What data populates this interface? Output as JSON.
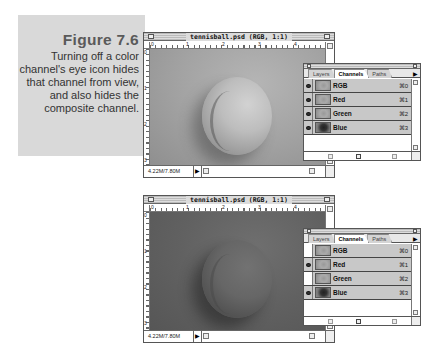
{
  "caption": {
    "figure": "Figure 7.6",
    "text": "Turning off a color channel's eye icon hides that channel from view, and also hides the composite channel."
  },
  "windows": [
    {
      "id": "top",
      "title": "tennisball.psd (RGB, 1:1)",
      "ruler_h": [
        "0",
        "1",
        "2",
        "3",
        "4"
      ],
      "ruler_v": [
        "0",
        "1",
        "2",
        "3"
      ],
      "status": "4.22M/7.80M",
      "play_icon": "▶"
    },
    {
      "id": "bottom",
      "title": "tennisball.psd (RGB, 1:1)",
      "ruler_h": [
        "0",
        "1",
        "2",
        "3",
        "4"
      ],
      "ruler_v": [
        "0",
        "1",
        "2",
        "3"
      ],
      "status": "4.22M/7.80M",
      "play_icon": "▶"
    }
  ],
  "palettes": [
    {
      "tabs": [
        "Layers",
        "Channels",
        "Paths"
      ],
      "active_tab": "Channels",
      "menu_arrow": "▶",
      "channels": [
        {
          "name": "RGB",
          "shortcut": "⌘0",
          "visible": true
        },
        {
          "name": "Red",
          "shortcut": "⌘1",
          "visible": true
        },
        {
          "name": "Green",
          "shortcut": "⌘2",
          "visible": true
        },
        {
          "name": "Blue",
          "shortcut": "⌘3",
          "visible": true
        }
      ]
    },
    {
      "tabs": [
        "Layers",
        "Channels",
        "Paths"
      ],
      "active_tab": "Channels",
      "menu_arrow": "▶",
      "channels": [
        {
          "name": "RGB",
          "shortcut": "⌘0",
          "visible": false
        },
        {
          "name": "Red",
          "shortcut": "⌘1",
          "visible": true
        },
        {
          "name": "Green",
          "shortcut": "⌘2",
          "visible": false
        },
        {
          "name": "Blue",
          "shortcut": "⌘3",
          "visible": true
        }
      ]
    }
  ]
}
